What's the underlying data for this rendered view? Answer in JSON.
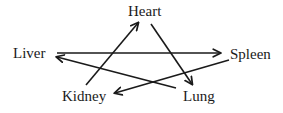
{
  "diagram": {
    "type": "directed-cycle",
    "nodes": [
      {
        "id": "heart",
        "label": "Heart",
        "x": 147,
        "y": 13
      },
      {
        "id": "liver",
        "label": "Liver",
        "x": 31,
        "y": 54
      },
      {
        "id": "spleen",
        "label": "Spleen",
        "x": 252,
        "y": 55
      },
      {
        "id": "kidney",
        "label": "Kidney",
        "x": 85,
        "y": 97
      },
      {
        "id": "lung",
        "label": "Lung",
        "x": 200,
        "y": 97
      }
    ],
    "edges": [
      {
        "from": "kidney",
        "to": "heart"
      },
      {
        "from": "heart",
        "to": "lung"
      },
      {
        "from": "lung",
        "to": "liver"
      },
      {
        "from": "liver",
        "to": "spleen"
      },
      {
        "from": "spleen",
        "to": "kidney"
      }
    ],
    "colors": {
      "stroke": "#1a1a1a",
      "text": "#1a1a1a",
      "background": "#ffffff"
    }
  }
}
